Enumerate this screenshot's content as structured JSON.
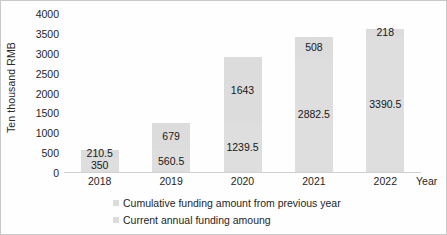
{
  "chart_data": {
    "type": "bar",
    "stacked": true,
    "title": "",
    "subtitle": "",
    "xlabel": "Year",
    "ylabel": "Ten thousand RMB",
    "categories": [
      "2018",
      "2019",
      "2020",
      "2021",
      "2022"
    ],
    "ylim": [
      0,
      4000
    ],
    "ytick_labels": [
      "0",
      "500",
      "1000",
      "1500",
      "2000",
      "2500",
      "3000",
      "3500",
      "4000"
    ],
    "ytick_values": [
      0,
      500,
      1000,
      1500,
      2000,
      2500,
      3000,
      3500,
      4000
    ],
    "grid": false,
    "legend_position": "bottom",
    "series": [
      {
        "name": "Cumulative funding amount from previous year",
        "values": [
          350,
          560.5,
          1239.5,
          2882.5,
          3390.5
        ],
        "labels": [
          "350",
          "560.5",
          "1239.5",
          "2882.5",
          "3390.5"
        ],
        "color": "#dedede",
        "stack_position": "bottom"
      },
      {
        "name": "Current annual funding amoung",
        "values": [
          210.5,
          679,
          1643,
          508,
          218
        ],
        "labels": [
          "210.5",
          "679",
          "1643",
          "508",
          "218"
        ],
        "color": "#dcdcdc",
        "stack_position": "top"
      }
    ],
    "totals": [
      560.5,
      1239.5,
      2882.5,
      3390.5,
      3608.5
    ]
  },
  "legend": {
    "items": [
      {
        "label": "Cumulative funding amount from previous year"
      },
      {
        "label": "Current annual funding amoung"
      }
    ]
  },
  "colors": {
    "bar_top": "#dcdcdc",
    "bar_bottom": "#dedede",
    "axis": "#d0d0d0",
    "text": "#1f1f1f",
    "frame": "#c9c9c9"
  }
}
